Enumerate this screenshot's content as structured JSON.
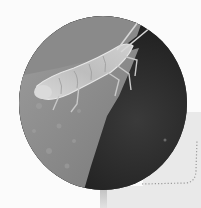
{
  "image": {
    "subject": "insect on leaf edge",
    "description": "Circular black-and-white close-up photo of a pale insect nymph resting on the edge of a gray leaf against a dark background",
    "colors": {
      "leaf": "#8e8e8e",
      "background_dark": "#262626",
      "insect": "#d2d2d2",
      "panel": "#e9e9e9",
      "page": "#fbfbfb",
      "dotted_line": "#9a9a9a"
    }
  }
}
